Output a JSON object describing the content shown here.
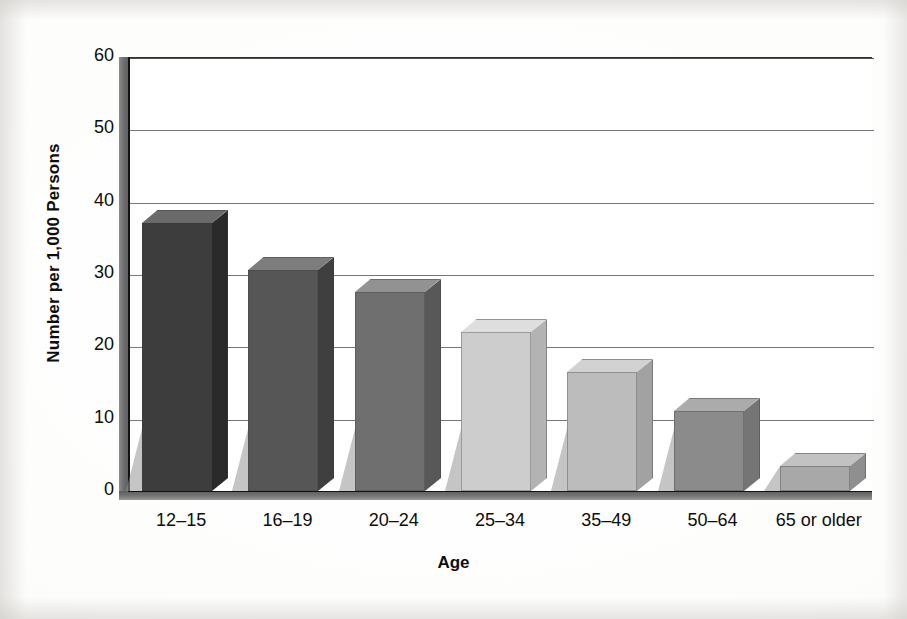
{
  "chart_data": {
    "type": "bar",
    "title": "",
    "subtitle": "",
    "xlabel": "Age",
    "ylabel": "Number per 1,000 Persons",
    "categories": [
      "12–15",
      "16–19",
      "20–24",
      "25–34",
      "35–49",
      "50–64",
      "65 or older"
    ],
    "values": [
      37,
      30.5,
      27.5,
      22,
      16.5,
      11,
      3.5
    ],
    "ylim": [
      0,
      60
    ],
    "ytick_values": [
      0,
      10,
      20,
      30,
      40,
      50,
      60
    ],
    "ytick_labels": [
      "0",
      "10",
      "20",
      "30",
      "40",
      "50",
      "60"
    ],
    "grid": "horizontal",
    "legend": "none",
    "three_d": true,
    "bar_colors": [
      "#3d3d3d",
      "#565656",
      "#6f6f6f",
      "#cdcdcd",
      "#bcbcbc",
      "#8b8b8b",
      "#a8a8a8"
    ],
    "bar_top_colors": [
      "#6a6a6a",
      "#7d7d7d",
      "#929292",
      "#dedede",
      "#d2d2d2",
      "#ababab",
      "#c2c2c2"
    ],
    "bar_side_colors": [
      "#2a2a2a",
      "#3f3f3f",
      "#585858",
      "#b3b3b3",
      "#a2a2a2",
      "#757575",
      "#8f8f8f"
    ],
    "annotations": []
  },
  "axes": {
    "y_title": "Number per 1,000 Persons",
    "x_title": "Age"
  },
  "ticks": {
    "y": [
      "60",
      "50",
      "40",
      "30",
      "20",
      "10",
      "0"
    ]
  }
}
